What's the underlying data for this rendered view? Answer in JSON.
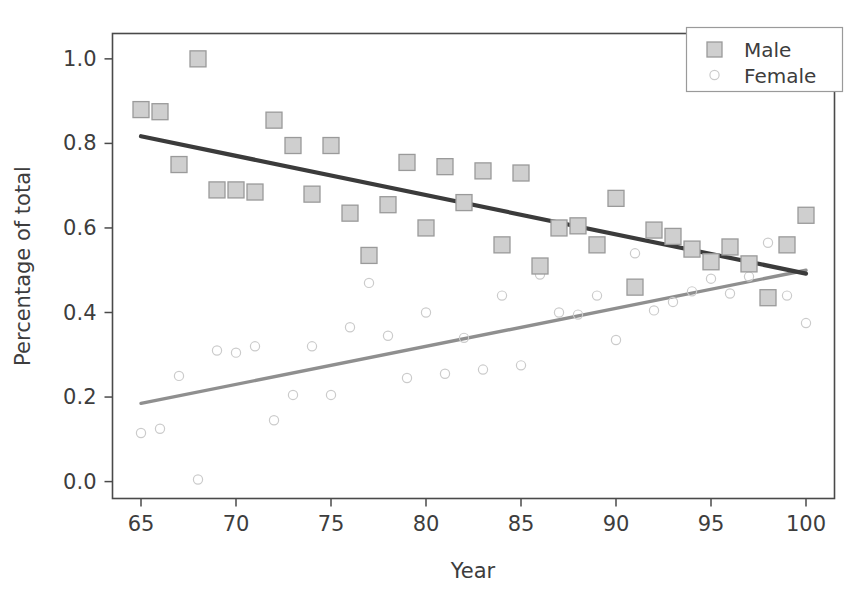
{
  "chart_data": {
    "type": "scatter",
    "title": "",
    "xlabel": "Year",
    "ylabel": "Percentage of total",
    "xlim": [
      63.5,
      101.5
    ],
    "ylim": [
      -0.04,
      1.06
    ],
    "xticks": [
      65,
      70,
      75,
      80,
      85,
      90,
      95,
      100
    ],
    "xtick_labels": [
      "65",
      "70",
      "75",
      "80",
      "85",
      "90",
      "95",
      "100"
    ],
    "yticks": [
      0.0,
      0.2,
      0.4,
      0.6,
      0.8,
      1.0
    ],
    "ytick_labels": [
      "0.0",
      "0.2",
      "0.4",
      "0.6",
      "0.8",
      "1.0"
    ],
    "grid": false,
    "legend_position": "upper right",
    "legend_entries": [
      "Male",
      "Female"
    ],
    "series": [
      {
        "name": "Male",
        "marker": "square",
        "color": "#cfcfcf",
        "edge_color": "#9a9a9a",
        "x": [
          65,
          66,
          67,
          68,
          69,
          70,
          71,
          72,
          73,
          74,
          75,
          76,
          77,
          78,
          79,
          80,
          81,
          82,
          83,
          84,
          85,
          86,
          87,
          88,
          89,
          90,
          91,
          92,
          93,
          94,
          95,
          96,
          97,
          98,
          99,
          100
        ],
        "y": [
          0.88,
          0.875,
          0.75,
          1.0,
          0.69,
          0.69,
          0.685,
          0.855,
          0.795,
          0.68,
          0.795,
          0.635,
          0.535,
          0.655,
          0.755,
          0.6,
          0.745,
          0.66,
          0.735,
          0.56,
          0.73,
          0.51,
          0.6,
          0.605,
          0.56,
          0.67,
          0.46,
          0.595,
          0.58,
          0.55,
          0.52,
          0.555,
          0.515,
          0.435,
          0.56,
          0.63
        ],
        "trendline": {
          "x": [
            65,
            100
          ],
          "y": [
            0.817,
            0.492
          ],
          "color": "#3b3b3b"
        }
      },
      {
        "name": "Female",
        "marker": "circle-open",
        "color": "#cbcbcb",
        "edge_color": "#cbcbcb",
        "x": [
          65,
          66,
          67,
          68,
          69,
          70,
          71,
          72,
          73,
          74,
          75,
          76,
          77,
          78,
          79,
          80,
          81,
          82,
          83,
          84,
          85,
          86,
          87,
          88,
          89,
          90,
          91,
          92,
          93,
          94,
          95,
          96,
          97,
          98,
          99,
          100
        ],
        "y": [
          0.115,
          0.125,
          0.25,
          0.005,
          0.31,
          0.305,
          0.32,
          0.145,
          0.205,
          0.32,
          0.205,
          0.365,
          0.47,
          0.345,
          0.245,
          0.4,
          0.255,
          0.34,
          0.265,
          0.44,
          0.275,
          0.49,
          0.4,
          0.395,
          0.44,
          0.335,
          0.54,
          0.405,
          0.425,
          0.45,
          0.48,
          0.445,
          0.485,
          0.565,
          0.44,
          0.375
        ],
        "trendline": {
          "x": [
            65,
            100
          ],
          "y": [
            0.185,
            0.5
          ],
          "color": "#8f8f8f"
        }
      }
    ]
  },
  "legend": {
    "male_label": "Male",
    "female_label": "Female"
  },
  "axes": {
    "xlabel": "Year",
    "ylabel": "Percentage of total"
  }
}
